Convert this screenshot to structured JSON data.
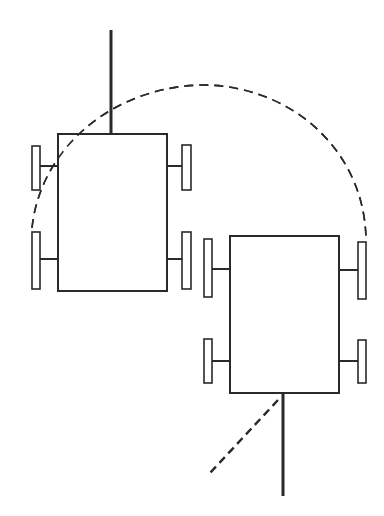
{
  "diagram": {
    "stroke_color": "#2a2a2a",
    "background": "#ffffff",
    "robots": [
      {
        "id": "robot-start",
        "body": {
          "x": 58,
          "y": 134,
          "w": 109,
          "h": 157
        },
        "heading_line": {
          "x1": 111,
          "y1": 30,
          "x2": 111,
          "y2": 134
        },
        "wheels": [
          {
            "x": 32,
            "y": 146,
            "w": 8,
            "h": 44,
            "axle_y": 166,
            "side": "left"
          },
          {
            "x": 32,
            "y": 232,
            "w": 8,
            "h": 57,
            "axle_y": 259,
            "side": "left"
          },
          {
            "x": 182,
            "y": 145,
            "w": 9,
            "h": 45,
            "axle_y": 166,
            "side": "right"
          },
          {
            "x": 182,
            "y": 232,
            "w": 9,
            "h": 57,
            "axle_y": 259,
            "side": "right"
          }
        ]
      },
      {
        "id": "robot-end",
        "body": {
          "x": 230,
          "y": 236,
          "w": 109,
          "h": 157
        },
        "heading_line": {
          "x1": 283,
          "y1": 393,
          "x2": 283,
          "y2": 496
        },
        "wheels": [
          {
            "x": 204,
            "y": 239,
            "w": 8,
            "h": 58,
            "axle_y": 269,
            "side": "left"
          },
          {
            "x": 204,
            "y": 339,
            "w": 8,
            "h": 44,
            "axle_y": 361,
            "side": "left"
          },
          {
            "x": 358,
            "y": 242,
            "w": 8,
            "h": 57,
            "axle_y": 270,
            "side": "right"
          },
          {
            "x": 358,
            "y": 340,
            "w": 8,
            "h": 43,
            "axle_y": 361,
            "side": "right"
          }
        ]
      }
    ],
    "turn_arc_path": "M 32 228 C 40 150, 110 88, 200 85 C 290 84, 365 150, 366 240",
    "offset_dashed_line": {
      "x1": 278,
      "y1": 400,
      "x2": 210,
      "y2": 473
    }
  }
}
